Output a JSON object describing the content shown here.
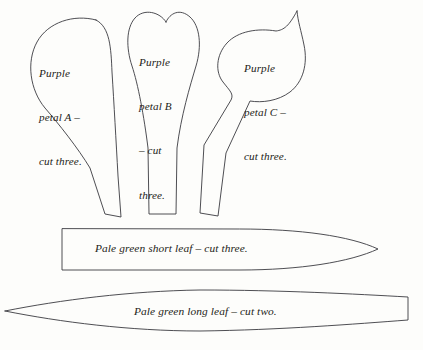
{
  "document": {
    "title": "Flower pattern template sheet",
    "background_color": "#fdfdfb",
    "ink_color": "#3a3a3f",
    "text_color": "#1d1d20"
  },
  "pieces": [
    {
      "id": "petal-a",
      "name": "Purple petal A",
      "shape": "teardrop",
      "label_lines": [
        "Purple",
        "petal A –",
        "cut three."
      ],
      "label_text": "Purple petal A – cut three.",
      "quantity_text": "cut three.",
      "quantity": 3
    },
    {
      "id": "petal-b",
      "name": "Purple petal B",
      "shape": "heart-notched",
      "label_lines": [
        "Purple",
        "petal B",
        "– cut",
        "three."
      ],
      "label_text": "Purple petal B – cut three.",
      "quantity_text": "cut three.",
      "quantity": 3
    },
    {
      "id": "petal-c",
      "name": "Purple petal C",
      "shape": "pointed-leaf-with-stem",
      "label_lines": [
        "Purple",
        "petal C –",
        "cut three."
      ],
      "label_text": "Purple petal C – cut three.",
      "quantity_text": "cut three.",
      "quantity": 3
    },
    {
      "id": "leaf-short",
      "name": "Pale green short leaf",
      "shape": "flat-left-pointed-right",
      "label_lines": [
        "Pale green short leaf – cut three."
      ],
      "label_text": "Pale green short leaf – cut three.",
      "quantity_text": "cut three.",
      "quantity": 3
    },
    {
      "id": "leaf-long",
      "name": "Pale green long leaf",
      "shape": "pointed-left-flat-right",
      "label_lines": [
        "Pale green long leaf – cut two."
      ],
      "label_text": "Pale green long leaf – cut two.",
      "quantity_text": "cut two.",
      "quantity": 2
    }
  ],
  "labels": {
    "petal_a_line1": "Purple",
    "petal_a_line2": "petal A –",
    "petal_a_line3": "cut three.",
    "petal_b_line1": "Purple",
    "petal_b_line2": "petal B",
    "petal_b_line3": "– cut",
    "petal_b_line4": "three.",
    "petal_c_line1": "Purple",
    "petal_c_line2": "petal C –",
    "petal_c_line3": "cut three.",
    "leaf_short": "Pale green short leaf – cut three.",
    "leaf_long": "Pale green long leaf – cut two."
  }
}
